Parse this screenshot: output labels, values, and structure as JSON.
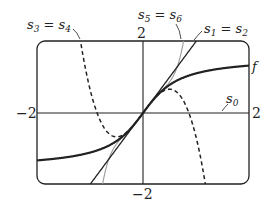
{
  "chart_data": {
    "type": "line",
    "title": "",
    "xlabel": "",
    "ylabel": "",
    "xlim": [
      -2,
      2
    ],
    "ylim": [
      -2,
      2
    ],
    "grid": false,
    "tick_labels": {
      "x_left": "−2",
      "x_right": "2",
      "y_top": "2",
      "y_bottom": "−2"
    },
    "series": [
      {
        "name": "f",
        "formula": "arctan(2x)",
        "style": "thick solid",
        "label": "f"
      },
      {
        "name": "s0",
        "formula": "0",
        "style": "solid",
        "label": "s0"
      },
      {
        "name": "s1 = s2",
        "formula": "2x",
        "style": "solid",
        "label": "s1 = s2"
      },
      {
        "name": "s3 = s4",
        "formula": "2x - 8x^3/3",
        "style": "dashed",
        "label": "s3 = s4"
      },
      {
        "name": "s5 = s6",
        "formula": "2x - 8x^3/3 + 32x^5/5",
        "style": "thin gray solid",
        "label": "s5 = s6"
      }
    ]
  },
  "labels": {
    "f": "f",
    "s0": "s",
    "s0_sub": "0",
    "s1": "s",
    "s1_sub": "1",
    "s1eq": " = s",
    "s2_sub": "2",
    "s3": "s",
    "s3_sub": "3",
    "s3eq": " = s",
    "s4_sub": "4",
    "s5": "s",
    "s5_sub": "5",
    "s5eq": " = s",
    "s6_sub": "6",
    "x_left": "−2",
    "x_right": "2",
    "y_top": "2",
    "y_bottom": "−2"
  }
}
